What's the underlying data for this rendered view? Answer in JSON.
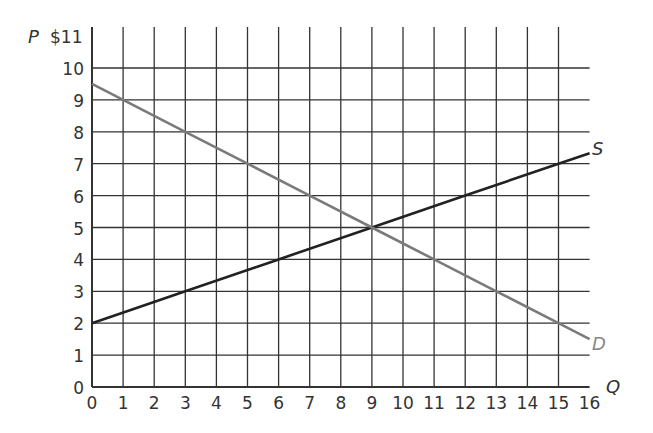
{
  "chart_data": {
    "type": "line",
    "title": "",
    "xlabel": "Q",
    "ylabel": "P",
    "y_top_label": "$11",
    "xlim": [
      0,
      16
    ],
    "ylim": [
      0,
      11
    ],
    "grid": true,
    "x_ticks": [
      "0",
      "1",
      "2",
      "3",
      "4",
      "5",
      "6",
      "7",
      "8",
      "9",
      "10",
      "11",
      "12",
      "13",
      "14",
      "15",
      "16"
    ],
    "y_ticks": [
      "0",
      "1",
      "2",
      "3",
      "4",
      "5",
      "6",
      "7",
      "8",
      "9",
      "10"
    ],
    "series": [
      {
        "name": "S",
        "color": "#222222",
        "x": [
          0,
          3,
          6,
          9,
          12,
          15,
          16
        ],
        "y": [
          2,
          3,
          4,
          5,
          6,
          7,
          7.33
        ]
      },
      {
        "name": "D",
        "color": "#7a7a7a",
        "x": [
          0,
          1,
          3,
          5,
          7,
          9,
          11,
          13,
          15,
          16
        ],
        "y": [
          9.5,
          9,
          8,
          7,
          6,
          5,
          4,
          3,
          2,
          1.5
        ]
      }
    ],
    "equilibrium": {
      "Q": 9,
      "P": 5
    }
  },
  "labels": {
    "p_axis": "P",
    "q_axis": "Q",
    "top_price": "$11",
    "supply": "S",
    "demand": "D"
  }
}
